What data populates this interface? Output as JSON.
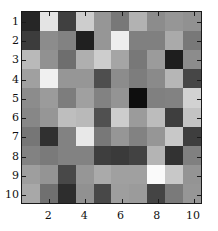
{
  "figure": {
    "type": "grayscale-matrix-plot",
    "background_color": "#ffffff",
    "axis_color": "#1a1a1a"
  },
  "axes": {
    "x": {
      "label": "",
      "tick_values": [
        2,
        4,
        6,
        8,
        10
      ],
      "tick_labels": [
        "2",
        "4",
        "6",
        "8",
        "10"
      ],
      "range": [
        0.5,
        10.5
      ]
    },
    "y": {
      "label": "",
      "tick_values": [
        1,
        2,
        3,
        4,
        5,
        6,
        7,
        8,
        9,
        10
      ],
      "tick_labels": [
        "1",
        "2",
        "3",
        "4",
        "5",
        "6",
        "7",
        "8",
        "9",
        "10"
      ],
      "range": [
        0.5,
        10.5
      ],
      "direction": "top-to-bottom"
    }
  },
  "chart_data": {
    "type": "heatmap",
    "title": "",
    "xlabel": "",
    "ylabel": "",
    "colormap": "gray",
    "rows": 10,
    "cols": 10,
    "xlim": [
      0.5,
      10.5
    ],
    "ylim": [
      10.5,
      0.5
    ],
    "x_tick_labels": [
      "2",
      "4",
      "6",
      "8",
      "10"
    ],
    "y_tick_labels": [
      "1",
      "2",
      "3",
      "4",
      "5",
      "6",
      "7",
      "8",
      "9",
      "10"
    ],
    "grid": false,
    "legend": "none",
    "value_range": [
      0,
      255
    ],
    "values": [
      [
        38,
        228,
        64,
        205,
        150,
        120,
        178,
        140,
        150,
        145
      ],
      [
        60,
        140,
        130,
        32,
        150,
        238,
        128,
        128,
        170,
        120
      ],
      [
        185,
        145,
        110,
        175,
        205,
        165,
        120,
        155,
        30,
        140
      ],
      [
        160,
        240,
        150,
        150,
        78,
        140,
        125,
        138,
        182,
        70
      ],
      [
        140,
        155,
        125,
        160,
        130,
        148,
        14,
        128,
        130,
        210
      ],
      [
        135,
        150,
        190,
        185,
        80,
        205,
        155,
        188,
        62,
        195
      ],
      [
        118,
        48,
        130,
        232,
        120,
        150,
        130,
        150,
        200,
        62
      ],
      [
        130,
        122,
        130,
        130,
        62,
        58,
        66,
        180,
        50,
        128
      ],
      [
        158,
        148,
        72,
        150,
        170,
        160,
        160,
        250,
        200,
        148
      ],
      [
        168,
        112,
        45,
        145,
        72,
        158,
        155,
        68,
        122,
        150
      ]
    ]
  }
}
